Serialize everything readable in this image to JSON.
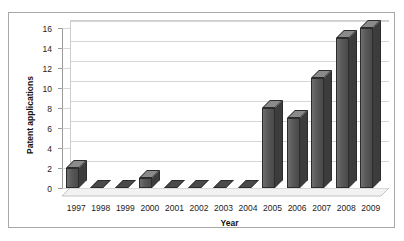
{
  "chart_data": {
    "type": "bar",
    "title": "",
    "xlabel": "Year",
    "ylabel": "Patent applications",
    "categories": [
      "1997",
      "1998",
      "1999",
      "2000",
      "2001",
      "2002",
      "2003",
      "2004",
      "2005",
      "2006",
      "2007",
      "2008",
      "2009"
    ],
    "values": [
      2,
      0,
      0,
      1,
      0,
      0,
      0,
      0,
      8,
      7,
      11,
      15,
      16
    ],
    "ylim": [
      0,
      16
    ],
    "yticks": [
      0,
      2,
      4,
      6,
      8,
      10,
      12,
      14,
      16
    ],
    "ytick_labels": [
      "0",
      "2",
      "4",
      "6",
      "8",
      "10",
      "12",
      "14",
      "16"
    ],
    "grid": true,
    "legend": false,
    "style": "3d-column",
    "bar_color": "#555555"
  },
  "colors": {
    "bar": "#555555",
    "bar_outline": "#2c2c2c",
    "gridline": "#d6d6d6",
    "axis": "#9a9a9a",
    "frame_border": "#a8a8a8",
    "background": "#ffffff",
    "text": "#1c1c1c"
  }
}
